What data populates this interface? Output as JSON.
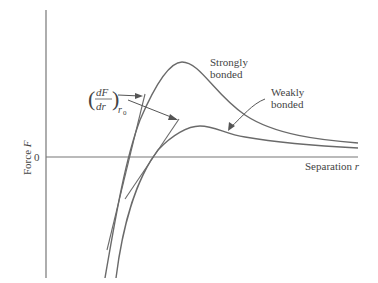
{
  "diagram": {
    "title": "",
    "axes": {
      "y_label_text": "Force ",
      "y_label_var": "F",
      "x_label_text": "Separation ",
      "x_label_var": "r",
      "zero_tick": "0"
    },
    "curves": [
      {
        "name": "Strongly bonded",
        "line1": "Strongly",
        "line2": "bonded"
      },
      {
        "name": "Weakly bonded",
        "line1": "Weakly",
        "line2": "bonded"
      }
    ],
    "annotation": {
      "numerator": "dF",
      "denominator": "dr",
      "subscript": "r",
      "subscript_index": "0"
    },
    "colors": {
      "curve": "#666666",
      "axis": "#555555",
      "text": "#444444"
    }
  }
}
